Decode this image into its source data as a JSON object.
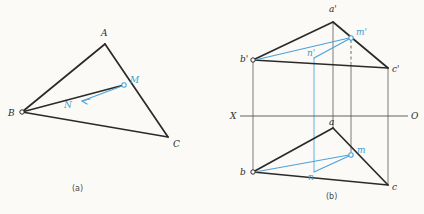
{
  "figure": {
    "caption_a": "(a)",
    "caption_b": "(b)",
    "background_color": "#fbfaf7",
    "line_color": "#2b2a28",
    "accent_color": "#4aa3da",
    "projection_line_color": "#6f6d69"
  },
  "diagram_a": {
    "name": "pictorial-triangle",
    "vertices": [
      {
        "id": "A",
        "label": "A",
        "x": 105,
        "y": 44,
        "marker": false
      },
      {
        "id": "B",
        "label": "B",
        "x": 22,
        "y": 112,
        "marker": true
      },
      {
        "id": "C",
        "label": "C",
        "x": 168,
        "y": 137,
        "marker": false
      }
    ],
    "points": [
      {
        "id": "M",
        "label": "M",
        "x": 124,
        "y": 85,
        "marker": true,
        "color": "#4aa3da"
      },
      {
        "id": "N",
        "label": "N",
        "x": 70,
        "y": 104,
        "marker": false,
        "color": "#4aa3da"
      }
    ],
    "edges": [
      {
        "from": "B",
        "to": "A"
      },
      {
        "from": "A",
        "to": "C"
      },
      {
        "from": "B",
        "to": "C"
      }
    ],
    "accent_edges": [
      {
        "from": "B",
        "to": "M"
      }
    ]
  },
  "diagram_b": {
    "name": "orthographic-projection",
    "axis": {
      "left_label": "X",
      "right_label": "O",
      "y": 116,
      "x_start": 232,
      "x_end": 414
    },
    "upper_view": {
      "name": "frontal-projection",
      "vertices": [
        {
          "id": "a'",
          "label": "a'",
          "x": 333,
          "y": 16,
          "marker": false
        },
        {
          "id": "b'",
          "label": "b'",
          "x": 253,
          "y": 60,
          "marker": true
        },
        {
          "id": "c'",
          "label": "c'",
          "x": 388,
          "y": 68,
          "marker": false
        }
      ],
      "points": [
        {
          "id": "m'",
          "label": "m'",
          "x": 351,
          "y": 38,
          "marker": true,
          "color": "#4aa3da"
        },
        {
          "id": "n'",
          "label": "n'",
          "x": 314,
          "y": 58,
          "marker": false,
          "color": "#4aa3da"
        }
      ]
    },
    "lower_view": {
      "name": "horizontal-projection",
      "vertices": [
        {
          "id": "a",
          "label": "a",
          "x": 333,
          "y": 128,
          "marker": false
        },
        {
          "id": "b",
          "label": "b",
          "x": 253,
          "y": 172,
          "marker": true
        },
        {
          "id": "c",
          "label": "c",
          "x": 388,
          "y": 185,
          "marker": false
        }
      ],
      "points": [
        {
          "id": "m",
          "label": "m",
          "x": 351,
          "y": 155,
          "marker": true,
          "color": "#4aa3da"
        },
        {
          "id": "n",
          "label": "n",
          "x": 314,
          "y": 172,
          "marker": false,
          "color": "#4aa3da"
        }
      ]
    },
    "projection_lines": [
      {
        "name": "projector-b",
        "x": 253,
        "style": "solid"
      },
      {
        "name": "projector-a",
        "x": 333,
        "style": "solid"
      },
      {
        "name": "projector-c",
        "x": 388,
        "style": "solid"
      },
      {
        "name": "projector-m",
        "x": 351,
        "style": "dashed-upper"
      },
      {
        "name": "projector-n",
        "x": 314,
        "style": "accent"
      }
    ]
  }
}
